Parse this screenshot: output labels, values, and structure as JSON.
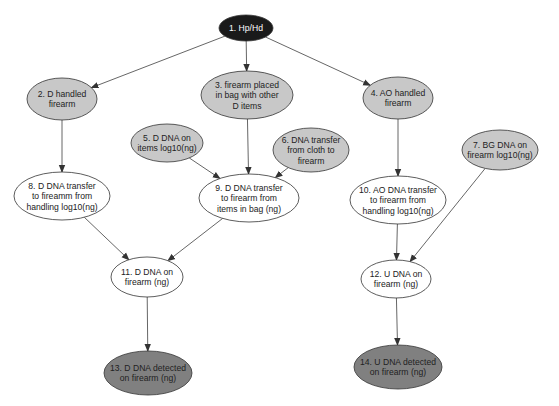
{
  "diagram": {
    "colors": {
      "root_fill": "#1a1a1a",
      "root_text": "#ffffff",
      "activity_fill": "#c8c8c8",
      "evidence_fill": "#808080",
      "latent_fill": "#ffffff",
      "stroke": "#333333",
      "edge": "#555555",
      "text": "#222222"
    },
    "nodes": [
      {
        "id": "1",
        "lines": [
          "1. Hp/Hd"
        ],
        "type": "root",
        "cx": 246,
        "cy": 28,
        "rx": 27,
        "ry": 13
      },
      {
        "id": "2",
        "lines": [
          "2. D handled",
          "firearm"
        ],
        "type": "activity",
        "cx": 62,
        "cy": 99,
        "rx": 35,
        "ry": 21
      },
      {
        "id": "3",
        "lines": [
          "3. firearm placed",
          "in bag with other",
          "D items"
        ],
        "type": "activity",
        "cx": 247,
        "cy": 95,
        "rx": 46,
        "ry": 24
      },
      {
        "id": "4",
        "lines": [
          "4. AO handled",
          "firearm"
        ],
        "type": "activity",
        "cx": 398,
        "cy": 98,
        "rx": 35,
        "ry": 21
      },
      {
        "id": "5",
        "lines": [
          "5. D DNA on",
          "items log10(ng)"
        ],
        "type": "activity",
        "cx": 167,
        "cy": 143,
        "rx": 36,
        "ry": 19
      },
      {
        "id": "6",
        "lines": [
          "6. DNA transfer",
          "from cloth to",
          "firearm"
        ],
        "type": "activity",
        "cx": 311,
        "cy": 150,
        "rx": 38,
        "ry": 22
      },
      {
        "id": "7",
        "lines": [
          "7. BG DNA on",
          "firearm log10(ng)"
        ],
        "type": "activity",
        "cx": 500,
        "cy": 150,
        "rx": 38,
        "ry": 20
      },
      {
        "id": "8",
        "lines": [
          "8. D DNA transfer",
          "to fireamm from",
          "handling log10(ng)"
        ],
        "type": "latent",
        "cx": 62,
        "cy": 196,
        "rx": 48,
        "ry": 24
      },
      {
        "id": "9",
        "lines": [
          "9. D DNA transfer",
          "to firearm from",
          "items in bag (ng)"
        ],
        "type": "latent",
        "cx": 249,
        "cy": 198,
        "rx": 50,
        "ry": 24
      },
      {
        "id": "10",
        "lines": [
          "10. AO DNA transfer",
          "to firearm from",
          "handling log10(ng)"
        ],
        "type": "latent",
        "cx": 398,
        "cy": 200,
        "rx": 48,
        "ry": 24
      },
      {
        "id": "11",
        "lines": [
          "11. D DNA on",
          "firearm (ng)"
        ],
        "type": "latent",
        "cx": 147,
        "cy": 277,
        "rx": 36,
        "ry": 20
      },
      {
        "id": "12",
        "lines": [
          "12. U DNA on",
          "firearm (ng)"
        ],
        "type": "latent",
        "cx": 396,
        "cy": 279,
        "rx": 35,
        "ry": 19
      },
      {
        "id": "13",
        "lines": [
          "13. D DNA detected",
          "on firearm (ng)"
        ],
        "type": "evidence",
        "cx": 148,
        "cy": 373,
        "rx": 44,
        "ry": 22
      },
      {
        "id": "14",
        "lines": [
          "14. U DNA detected",
          "on firearm (ng)"
        ],
        "type": "evidence",
        "cx": 398,
        "cy": 367,
        "rx": 44,
        "ry": 22
      }
    ],
    "edges": [
      {
        "from": "1",
        "to": "2"
      },
      {
        "from": "1",
        "to": "3"
      },
      {
        "from": "1",
        "to": "4"
      },
      {
        "from": "2",
        "to": "8"
      },
      {
        "from": "3",
        "to": "9"
      },
      {
        "from": "5",
        "to": "9"
      },
      {
        "from": "6",
        "to": "9"
      },
      {
        "from": "4",
        "to": "10"
      },
      {
        "from": "8",
        "to": "11"
      },
      {
        "from": "9",
        "to": "11"
      },
      {
        "from": "10",
        "to": "12"
      },
      {
        "from": "7",
        "to": "12"
      },
      {
        "from": "11",
        "to": "13"
      },
      {
        "from": "12",
        "to": "14"
      }
    ]
  }
}
